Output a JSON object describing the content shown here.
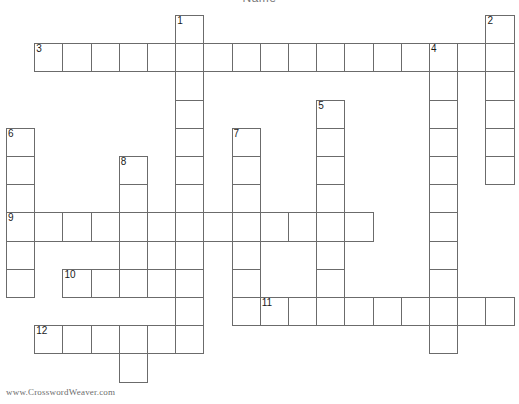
{
  "page": {
    "title_clipped": "Name",
    "watermark": "www.CrosswordWeaver.com",
    "background_color": "#ffffff",
    "cell_border_color": "#6b6b6b",
    "number_color": "#1a1a1a",
    "watermark_color": "#6d6d6d"
  },
  "grid": {
    "cell_size": 28.2,
    "origin_x": 6,
    "origin_y": 15,
    "columns": 18,
    "rows": 13,
    "cells": [
      {
        "c": 6,
        "r": 0,
        "n": "1"
      },
      {
        "c": 17,
        "r": 0,
        "n": "2"
      },
      {
        "c": 1,
        "r": 1,
        "n": "3"
      },
      {
        "c": 2,
        "r": 1,
        "n": ""
      },
      {
        "c": 3,
        "r": 1,
        "n": ""
      },
      {
        "c": 4,
        "r": 1,
        "n": ""
      },
      {
        "c": 5,
        "r": 1,
        "n": ""
      },
      {
        "c": 6,
        "r": 1,
        "n": ""
      },
      {
        "c": 7,
        "r": 1,
        "n": ""
      },
      {
        "c": 8,
        "r": 1,
        "n": ""
      },
      {
        "c": 9,
        "r": 1,
        "n": ""
      },
      {
        "c": 10,
        "r": 1,
        "n": ""
      },
      {
        "c": 11,
        "r": 1,
        "n": ""
      },
      {
        "c": 12,
        "r": 1,
        "n": ""
      },
      {
        "c": 13,
        "r": 1,
        "n": ""
      },
      {
        "c": 14,
        "r": 1,
        "n": ""
      },
      {
        "c": 15,
        "r": 1,
        "n": "4"
      },
      {
        "c": 16,
        "r": 1,
        "n": ""
      },
      {
        "c": 17,
        "r": 1,
        "n": ""
      },
      {
        "c": 6,
        "r": 2,
        "n": ""
      },
      {
        "c": 15,
        "r": 2,
        "n": ""
      },
      {
        "c": 17,
        "r": 2,
        "n": ""
      },
      {
        "c": 6,
        "r": 3,
        "n": ""
      },
      {
        "c": 11,
        "r": 3,
        "n": "5"
      },
      {
        "c": 15,
        "r": 3,
        "n": ""
      },
      {
        "c": 17,
        "r": 3,
        "n": ""
      },
      {
        "c": 0,
        "r": 4,
        "n": "6"
      },
      {
        "c": 6,
        "r": 4,
        "n": ""
      },
      {
        "c": 8,
        "r": 4,
        "n": "7"
      },
      {
        "c": 11,
        "r": 4,
        "n": ""
      },
      {
        "c": 15,
        "r": 4,
        "n": ""
      },
      {
        "c": 17,
        "r": 4,
        "n": ""
      },
      {
        "c": 0,
        "r": 5,
        "n": ""
      },
      {
        "c": 4,
        "r": 5,
        "n": "8"
      },
      {
        "c": 6,
        "r": 5,
        "n": ""
      },
      {
        "c": 8,
        "r": 5,
        "n": ""
      },
      {
        "c": 11,
        "r": 5,
        "n": ""
      },
      {
        "c": 15,
        "r": 5,
        "n": ""
      },
      {
        "c": 17,
        "r": 5,
        "n": ""
      },
      {
        "c": 0,
        "r": 6,
        "n": ""
      },
      {
        "c": 4,
        "r": 6,
        "n": ""
      },
      {
        "c": 6,
        "r": 6,
        "n": ""
      },
      {
        "c": 8,
        "r": 6,
        "n": ""
      },
      {
        "c": 11,
        "r": 6,
        "n": ""
      },
      {
        "c": 15,
        "r": 6,
        "n": ""
      },
      {
        "c": 0,
        "r": 7,
        "n": "9"
      },
      {
        "c": 1,
        "r": 7,
        "n": ""
      },
      {
        "c": 2,
        "r": 7,
        "n": ""
      },
      {
        "c": 3,
        "r": 7,
        "n": ""
      },
      {
        "c": 4,
        "r": 7,
        "n": ""
      },
      {
        "c": 5,
        "r": 7,
        "n": ""
      },
      {
        "c": 6,
        "r": 7,
        "n": ""
      },
      {
        "c": 7,
        "r": 7,
        "n": ""
      },
      {
        "c": 8,
        "r": 7,
        "n": ""
      },
      {
        "c": 9,
        "r": 7,
        "n": ""
      },
      {
        "c": 10,
        "r": 7,
        "n": ""
      },
      {
        "c": 11,
        "r": 7,
        "n": ""
      },
      {
        "c": 12,
        "r": 7,
        "n": ""
      },
      {
        "c": 15,
        "r": 7,
        "n": ""
      },
      {
        "c": 0,
        "r": 8,
        "n": ""
      },
      {
        "c": 4,
        "r": 8,
        "n": ""
      },
      {
        "c": 6,
        "r": 8,
        "n": ""
      },
      {
        "c": 8,
        "r": 8,
        "n": ""
      },
      {
        "c": 11,
        "r": 8,
        "n": ""
      },
      {
        "c": 15,
        "r": 8,
        "n": ""
      },
      {
        "c": 0,
        "r": 9,
        "n": ""
      },
      {
        "c": 2,
        "r": 9,
        "n": "10"
      },
      {
        "c": 3,
        "r": 9,
        "n": ""
      },
      {
        "c": 4,
        "r": 9,
        "n": ""
      },
      {
        "c": 5,
        "r": 9,
        "n": ""
      },
      {
        "c": 6,
        "r": 9,
        "n": ""
      },
      {
        "c": 8,
        "r": 9,
        "n": ""
      },
      {
        "c": 11,
        "r": 9,
        "n": ""
      },
      {
        "c": 15,
        "r": 9,
        "n": ""
      },
      {
        "c": 6,
        "r": 10,
        "n": ""
      },
      {
        "c": 8,
        "r": 10,
        "n": ""
      },
      {
        "c": 9,
        "r": 10,
        "n": "11"
      },
      {
        "c": 10,
        "r": 10,
        "n": ""
      },
      {
        "c": 11,
        "r": 10,
        "n": ""
      },
      {
        "c": 12,
        "r": 10,
        "n": ""
      },
      {
        "c": 13,
        "r": 10,
        "n": ""
      },
      {
        "c": 14,
        "r": 10,
        "n": ""
      },
      {
        "c": 15,
        "r": 10,
        "n": ""
      },
      {
        "c": 16,
        "r": 10,
        "n": ""
      },
      {
        "c": 17,
        "r": 10,
        "n": ""
      },
      {
        "c": 1,
        "r": 11,
        "n": "12"
      },
      {
        "c": 2,
        "r": 11,
        "n": ""
      },
      {
        "c": 3,
        "r": 11,
        "n": ""
      },
      {
        "c": 4,
        "r": 11,
        "n": ""
      },
      {
        "c": 5,
        "r": 11,
        "n": ""
      },
      {
        "c": 6,
        "r": 11,
        "n": ""
      },
      {
        "c": 15,
        "r": 11,
        "n": ""
      },
      {
        "c": 4,
        "r": 12,
        "n": ""
      }
    ]
  }
}
